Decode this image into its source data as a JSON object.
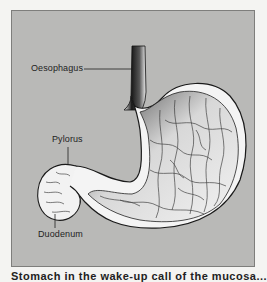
{
  "figure": {
    "type": "anatomical-illustration",
    "subject": "stomach",
    "background_color": "#b9b9b7",
    "frame_border_color": "#7e7e7c",
    "labels": [
      {
        "id": "oesophagus",
        "text": "Oesophagus"
      },
      {
        "id": "pylorus",
        "text": "Pylorus"
      },
      {
        "id": "duodenum",
        "text": "Duodenum"
      }
    ],
    "caption": "Stomach in the wake-up call of the mucosa..."
  }
}
